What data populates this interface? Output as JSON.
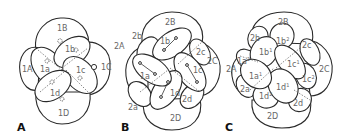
{
  "figure": {
    "panels": [
      {
        "id": "A",
        "label": "A",
        "stage": "8-cell",
        "cells": {
          "macromeres": [
            "1A",
            "1B",
            "1C",
            "1D"
          ],
          "micromeres": [
            "1a",
            "1b",
            "1c",
            "1d"
          ]
        }
      },
      {
        "id": "B",
        "label": "B",
        "stage": "16-cell",
        "cells": {
          "macromeres": [
            "2A",
            "2B",
            "2C",
            "2D"
          ],
          "second_quartet": [
            "2a",
            "2b",
            "2c",
            "2d"
          ],
          "first_quartet": [
            "1a",
            "1b",
            "1c",
            "1d"
          ]
        }
      },
      {
        "id": "C",
        "label": "C",
        "stage": "later cleavage",
        "cells": {
          "macromeres": [
            "2A",
            "2B",
            "2C",
            "2D"
          ],
          "second_quartet": [
            "2a",
            "2b",
            "2c",
            "2d"
          ],
          "first_quartet_daughters": [
            "1a¹",
            "1a²",
            "1b¹",
            "1b²",
            "1c¹",
            "1c²",
            "1d¹",
            "1d²"
          ]
        }
      }
    ],
    "labels": {
      "A": {
        "B": "1B",
        "A": "1A",
        "C": "1C",
        "D": "1D",
        "a": "1a",
        "b": "1b",
        "c": "1c",
        "d": "1d"
      },
      "B": {
        "B": "2B",
        "A": "2A",
        "C": "2C",
        "D": "2D",
        "a2": "2a",
        "b2": "2b",
        "c2": "2c",
        "d2": "2d",
        "a": "1a",
        "b": "1b",
        "c": "1c",
        "d": "1d"
      },
      "C": {
        "B": "2B",
        "A": "2A",
        "C": "2C",
        "D": "2D",
        "a2": "2a",
        "b2": "2b",
        "c2": "2c",
        "d2": "2d",
        "a1_base": "1a",
        "a1_sup": "1",
        "a2_base": "1a",
        "a2_sup": "2",
        "b1_base": "1b",
        "b1_sup": "1",
        "b2_base": "1b",
        "b2_sup": "2",
        "c1_base": "1c",
        "c1_sup": "1",
        "c2_base": "1c",
        "c2_sup": "2",
        "d1_base": "1d",
        "d1_sup": "1",
        "d2_base": "1d",
        "d2_sup": "2"
      }
    }
  }
}
